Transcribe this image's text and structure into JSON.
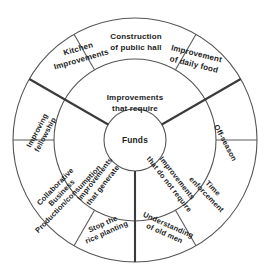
{
  "diagram": {
    "type": "concentric-radial-sector-diagram",
    "center": {
      "label": "Funds",
      "name": "center-node-funds"
    },
    "rings": [
      {
        "name": "center-ring",
        "radius": 31
      },
      {
        "name": "middle-ring",
        "radius": 81
      },
      {
        "name": "outer-ring",
        "radius": 122
      }
    ],
    "sectors": [
      {
        "id": "top",
        "name": "sector-improvements-that-require",
        "middle_label_line1": "Improvements",
        "middle_label_line2": "that require",
        "outer_items": [
          {
            "name": "outer-label-kitchen-improvements",
            "line1": "Kitchen",
            "line2": "Improvements",
            "rotation": -22
          },
          {
            "name": "outer-label-construction-public-hall",
            "line1": "Construction",
            "line2": "of public hall",
            "rotation": 0
          },
          {
            "name": "outer-label-improvement-daily-food",
            "line1": "Improvement",
            "line2": "of daily food",
            "rotation": 22
          }
        ]
      },
      {
        "id": "left",
        "name": "sector-improvements-that-generate",
        "middle_label_line1": "Improvements",
        "middle_label_line2": "that generate",
        "outer_items": [
          {
            "name": "outer-label-improving-fellowship",
            "line1": "Improving",
            "line2": "fellowship",
            "rotation": -62
          },
          {
            "name": "outer-label-collaborative-business",
            "line1": "Collaborative",
            "line2": "Business",
            "line3": "Production/consumption",
            "rotation": -46
          },
          {
            "name": "outer-label-stop-rice-planting",
            "line1": "Stop the",
            "line2": "rice planting",
            "rotation": -24
          }
        ]
      },
      {
        "id": "right",
        "name": "sector-improvements-that-do-not-require",
        "middle_label_line1": "Improvements",
        "middle_label_line2": "that do not require",
        "outer_items": [
          {
            "name": "outer-label-off-season",
            "line1": "Off-season",
            "rotation": 62
          },
          {
            "name": "outer-label-time-enforcement",
            "line1": "Time",
            "line2": "enforcement",
            "rotation": 46
          },
          {
            "name": "outer-label-understanding-old-men",
            "line1": "Understanding",
            "line2": "of old men",
            "rotation": 24
          }
        ]
      }
    ],
    "colors": {
      "stroke": "#555555",
      "spoke": "#3a3a3a",
      "text": "#1c1c1c",
      "background": "#ffffff"
    }
  }
}
